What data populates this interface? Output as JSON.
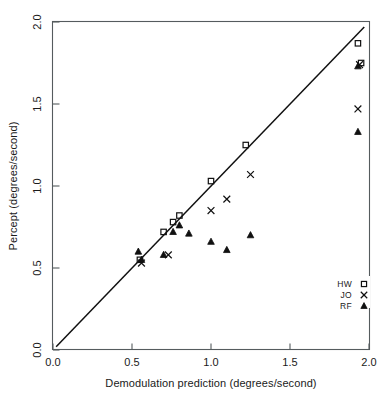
{
  "chart_data": {
    "type": "scatter",
    "title": "",
    "xlabel": "Demodulation prediction (degrees/second)",
    "ylabel": "Percept (degrees/second)",
    "xlim": [
      0.0,
      2.0
    ],
    "ylim": [
      0.0,
      2.0
    ],
    "xticks": [
      "0.0",
      "0.5",
      "1.0",
      "1.5",
      "2.0"
    ],
    "xtick_values": [
      0.0,
      0.5,
      1.0,
      1.5,
      2.0
    ],
    "yticks": [
      "0.0",
      "0.5",
      "1.0",
      "1.5",
      "2.0"
    ],
    "ytick_values": [
      0.0,
      0.5,
      1.0,
      1.5,
      2.0
    ],
    "grid": false,
    "legend_position": "bottom-right",
    "reference_line": {
      "name": "identity-line",
      "description": "unity diagonal y = x",
      "x": [
        0.02,
        1.97
      ],
      "y": [
        0.02,
        1.97
      ]
    },
    "series": [
      {
        "name": "HW",
        "marker": "square",
        "points": [
          [
            0.55,
            0.55
          ],
          [
            0.7,
            0.72
          ],
          [
            0.76,
            0.78
          ],
          [
            0.8,
            0.82
          ],
          [
            1.0,
            1.03
          ],
          [
            1.22,
            1.25
          ],
          [
            1.93,
            1.87
          ],
          [
            1.95,
            1.75
          ]
        ]
      },
      {
        "name": "JO",
        "marker": "cross",
        "points": [
          [
            0.56,
            0.53
          ],
          [
            0.73,
            0.58
          ],
          [
            1.0,
            0.85
          ],
          [
            1.1,
            0.92
          ],
          [
            1.25,
            1.07
          ],
          [
            1.93,
            1.47
          ],
          [
            1.94,
            1.74
          ]
        ]
      },
      {
        "name": "RF",
        "marker": "triangle",
        "points": [
          [
            0.54,
            0.6
          ],
          [
            0.56,
            0.55
          ],
          [
            0.7,
            0.58
          ],
          [
            0.76,
            0.72
          ],
          [
            0.8,
            0.76
          ],
          [
            0.86,
            0.71
          ],
          [
            1.0,
            0.66
          ],
          [
            1.1,
            0.61
          ],
          [
            1.25,
            0.7
          ],
          [
            1.93,
            1.33
          ],
          [
            1.93,
            1.73
          ]
        ]
      }
    ],
    "legend": [
      {
        "label": "HW",
        "marker": "square"
      },
      {
        "label": "JO",
        "marker": "cross"
      },
      {
        "label": "RF",
        "marker": "triangle"
      }
    ]
  },
  "colors": {
    "marker": "#101010",
    "line": "#101010",
    "axis": "#555b5e",
    "text": "#1a1a1a",
    "background": "#ffffff"
  }
}
